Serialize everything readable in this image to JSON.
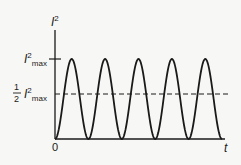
{
  "chart_data": {
    "type": "line",
    "title": "",
    "ylabel": "I²",
    "xlabel": "t",
    "origin_label": "0",
    "ytick_labels": {
      "max": "I²max",
      "half": "½ I²max"
    },
    "function": "I² = I²max · sin²(ωt)",
    "cycles": 5,
    "ylim": [
      0,
      1
    ],
    "reference_lines": [
      {
        "name": "half-max",
        "value": 0.5,
        "style": "dashed"
      }
    ],
    "peak_value": 1,
    "min_value": 0
  },
  "labels": {
    "y_axis": "I",
    "y_axis_sup": "2",
    "max_I": "I",
    "max_sup": "2",
    "max_sub": "max",
    "half_num": "1",
    "half_den": "2",
    "half_I": "I",
    "half_sup": "2",
    "half_sub": "max",
    "origin": "0",
    "x_axis": "t"
  },
  "colors": {
    "curve": "#1a1a1a",
    "axis": "#1a1a1a",
    "background": "#f7f7f5"
  }
}
